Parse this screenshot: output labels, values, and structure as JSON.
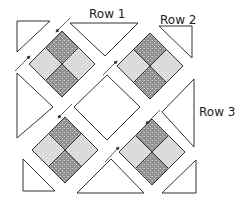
{
  "diagram": {
    "type": "quilt-assembly",
    "labels": [
      {
        "id": "row1",
        "text": "Row 1"
      },
      {
        "id": "row2",
        "text": "Row 2"
      },
      {
        "id": "row3",
        "text": "Row 3"
      }
    ],
    "colors": {
      "outline": "#333333",
      "dark_fabric": "#9a9a9a",
      "light_fabric": "#dcdcdc",
      "plain": "#ffffff"
    },
    "pieces": {
      "blocks": 4,
      "plain_squares": 1,
      "setting_triangles": 4,
      "corner_triangles": 4
    }
  }
}
